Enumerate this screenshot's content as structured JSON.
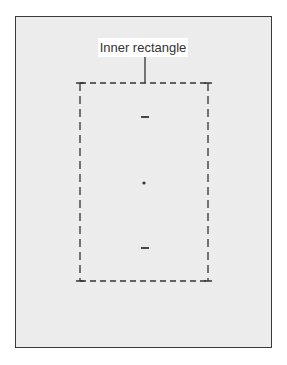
{
  "diagram": {
    "label": "Inner rectangle",
    "colors": {
      "background": "#ffffff",
      "frame_fill": "#ececec",
      "frame_border": "#3a3a3a",
      "stroke": "#333333"
    },
    "outer_frame": {
      "x": 15,
      "y": 16,
      "width": 257,
      "height": 332
    },
    "inner_rectangle": {
      "x": 80,
      "y": 83,
      "width": 128,
      "height": 198,
      "style": "dashed"
    },
    "marks": [
      {
        "type": "dash",
        "x": 145,
        "y": 117
      },
      {
        "type": "dot",
        "x": 144,
        "y": 183
      },
      {
        "type": "dash",
        "x": 145,
        "y": 248
      }
    ]
  }
}
